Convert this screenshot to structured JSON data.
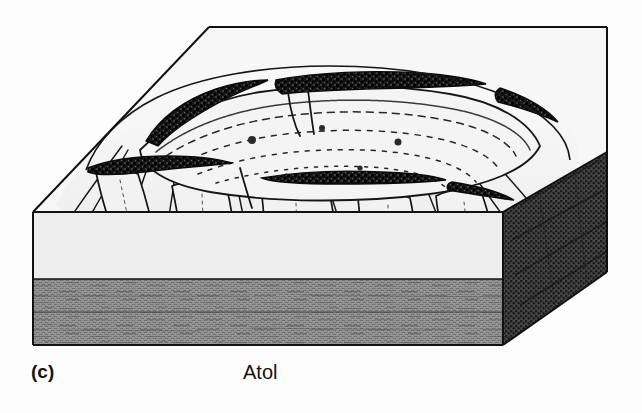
{
  "figure": {
    "caption_index": "(c)",
    "caption_title": "Atol",
    "alt_description": "Three-dimensional block diagram of an atoll: a ring-shaped coral reef enclosing a shallow central lagoon, rising from a submarine platform, drawn as a cut-away cube.",
    "colors": {
      "page_background": "#fdfdfd",
      "water_surface_top": "#f6f6f6",
      "block_light_face": "#efefef",
      "seafloor_sediment": "#8a8a8a",
      "right_face_dark": "#3d3d3d",
      "ink_line": "#111111",
      "reef_crest_dark": "#141414",
      "caption_text": "#141414"
    },
    "geometry": {
      "top_back_left": [
        209,
        27
      ],
      "top_back_right": [
        607,
        27
      ],
      "top_front_left": [
        33,
        212
      ],
      "top_front_right": [
        503,
        212
      ],
      "front_bottom_left": [
        33,
        345
      ],
      "front_bottom_right": [
        503,
        345
      ],
      "right_back_bottom": [
        607,
        152
      ],
      "sediment_line_y": 279,
      "waterline_y": 212,
      "block_bottom_y": 345
    },
    "features": [
      {
        "name": "water-surface-plane",
        "label": "Superfície do mar / top plane"
      },
      {
        "name": "lagoon",
        "label": "Central lagoon"
      },
      {
        "name": "reef-crest",
        "label": "Coral reef rim"
      },
      {
        "name": "reef-pass",
        "label": "Reef channel / pass"
      },
      {
        "name": "fore-reef-slope",
        "label": "Outer fore-reef slope"
      },
      {
        "name": "reef-buttresses",
        "label": "Spur and groove buttresses"
      },
      {
        "name": "sea-floor-sediment",
        "label": "Sea floor sediment layer"
      },
      {
        "name": "right-cut-face",
        "label": "Cut block right face"
      }
    ]
  }
}
